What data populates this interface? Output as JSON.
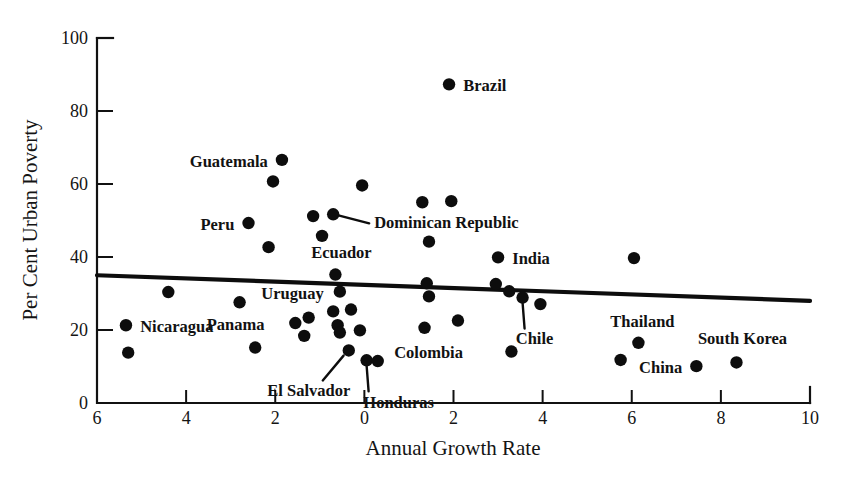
{
  "chart_data": {
    "type": "scatter",
    "title": "",
    "xlabel": "Annual Growth Rate",
    "ylabel": "Per Cent Urban Poverty",
    "xlim": [
      -6,
      10
    ],
    "ylim": [
      0,
      100
    ],
    "xticks": [
      -6,
      -4,
      -2,
      0,
      2,
      4,
      6,
      8,
      10
    ],
    "xticklabels": [
      "6",
      "4",
      "2",
      "0",
      "2",
      "4",
      "6",
      "8",
      "10"
    ],
    "yticks": [
      0,
      20,
      40,
      60,
      80,
      100
    ],
    "yticklabels": [
      "0",
      "20",
      "40",
      "60",
      "80",
      "100"
    ],
    "grid": false,
    "legend": false,
    "trendline": {
      "name": "regression-line",
      "x_start": -6,
      "y_start": 35.0,
      "x_end": 10,
      "y_end": 28.0
    },
    "points": [
      {
        "label": "Nicaragua",
        "label_pos": "right",
        "x": -5.35,
        "y": 21.3
      },
      {
        "label": "",
        "label_pos": "none",
        "x": -5.3,
        "y": 13.8
      },
      {
        "label": "",
        "label_pos": "none",
        "x": -4.4,
        "y": 30.4
      },
      {
        "label": "Panama",
        "label_pos": "below",
        "x": -2.8,
        "y": 27.6
      },
      {
        "label": "Guatemala",
        "label_pos": "left",
        "x": -1.85,
        "y": 66.6
      },
      {
        "label": "",
        "label_pos": "none",
        "x": -2.05,
        "y": 60.7
      },
      {
        "label": "Peru",
        "label_pos": "left",
        "x": -2.6,
        "y": 49.3
      },
      {
        "label": "",
        "label_pos": "none",
        "x": -2.15,
        "y": 42.7
      },
      {
        "label": "",
        "label_pos": "none",
        "x": -2.45,
        "y": 15.2
      },
      {
        "label": "",
        "label_pos": "none",
        "x": -1.55,
        "y": 21.9
      },
      {
        "label": "",
        "label_pos": "none",
        "x": -1.25,
        "y": 23.4
      },
      {
        "label": "",
        "label_pos": "none",
        "x": -1.35,
        "y": 18.4
      },
      {
        "label": "",
        "label_pos": "none",
        "x": -1.15,
        "y": 51.2
      },
      {
        "label": "",
        "label_pos": "none",
        "x": -0.95,
        "y": 45.8
      },
      {
        "label": "Dominican Republic",
        "label_pos": "right",
        "x": -0.7,
        "y": 51.7
      },
      {
        "label": "Ecuador",
        "label_pos": "above",
        "x": -0.65,
        "y": 35.2
      },
      {
        "label": "Uruguay",
        "label_pos": "left",
        "x": -0.55,
        "y": 30.5
      },
      {
        "label": "",
        "label_pos": "none",
        "x": -0.7,
        "y": 25.1
      },
      {
        "label": "",
        "label_pos": "none",
        "x": -0.6,
        "y": 21.3
      },
      {
        "label": "",
        "label_pos": "none",
        "x": -0.55,
        "y": 19.3
      },
      {
        "label": "El Salvador",
        "label_pos": "leader-sw",
        "x": -0.35,
        "y": 14.4
      },
      {
        "label": "",
        "label_pos": "none",
        "x": -0.3,
        "y": 25.6
      },
      {
        "label": "",
        "label_pos": "none",
        "x": -0.1,
        "y": 19.9
      },
      {
        "label": "Honduras",
        "label_pos": "leader-s",
        "x": 0.05,
        "y": 11.7
      },
      {
        "label": "",
        "label_pos": "none",
        "x": 0.3,
        "y": 11.5
      },
      {
        "label": "",
        "label_pos": "none",
        "x": -0.05,
        "y": 59.6
      },
      {
        "label": "",
        "label_pos": "none",
        "x": 1.3,
        "y": 55.0
      },
      {
        "label": "",
        "label_pos": "none",
        "x": 1.95,
        "y": 55.3
      },
      {
        "label": "",
        "label_pos": "none",
        "x": 1.45,
        "y": 44.2
      },
      {
        "label": "Brazil",
        "label_pos": "right",
        "x": 1.9,
        "y": 87.3
      },
      {
        "label": "",
        "label_pos": "none",
        "x": 1.4,
        "y": 32.8
      },
      {
        "label": "",
        "label_pos": "none",
        "x": 1.45,
        "y": 29.2
      },
      {
        "label": "Colombia",
        "label_pos": "below",
        "x": 1.35,
        "y": 20.6
      },
      {
        "label": "",
        "label_pos": "none",
        "x": 2.1,
        "y": 22.6
      },
      {
        "label": "India",
        "label_pos": "right",
        "x": 3.0,
        "y": 39.9
      },
      {
        "label": "",
        "label_pos": "none",
        "x": 2.95,
        "y": 32.6
      },
      {
        "label": "",
        "label_pos": "none",
        "x": 3.25,
        "y": 30.6
      },
      {
        "label": "Chile",
        "label_pos": "leader-s",
        "x": 3.55,
        "y": 28.9
      },
      {
        "label": "",
        "label_pos": "none",
        "x": 3.95,
        "y": 27.1
      },
      {
        "label": "",
        "label_pos": "none",
        "x": 3.3,
        "y": 14.1
      },
      {
        "label": "Thailand",
        "label_pos": "above",
        "x": 6.15,
        "y": 16.5
      },
      {
        "label": "",
        "label_pos": "none",
        "x": 5.75,
        "y": 11.8
      },
      {
        "label": "",
        "label_pos": "none",
        "x": 6.05,
        "y": 39.7
      },
      {
        "label": "China",
        "label_pos": "left",
        "x": 7.45,
        "y": 10.1
      },
      {
        "label": "South Korea",
        "label_pos": "above",
        "x": 8.35,
        "y": 11.1
      }
    ]
  },
  "colors": {
    "ink": "#0d0d0d",
    "background": "#ffffff",
    "trend": "#0d0d0d"
  }
}
